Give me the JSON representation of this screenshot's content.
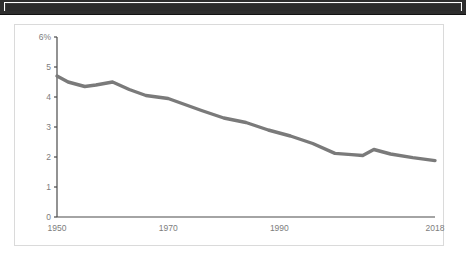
{
  "banner": {
    "name": "cropped-dark-banner-edge"
  },
  "chart_data": {
    "type": "line",
    "title": "",
    "subtitle": "",
    "xlabel": "",
    "ylabel": "",
    "grid": false,
    "legend": false,
    "line_color": "#7a7a7a",
    "axis_color": "#4a4a4a",
    "label_color": "#7d7d7d",
    "xlim": [
      1950,
      2018
    ],
    "ylim": [
      0,
      6
    ],
    "y_ticks": [
      0,
      1,
      2,
      3,
      4,
      5,
      6
    ],
    "y_tick_labels": [
      "0",
      "1",
      "2",
      "3",
      "4",
      "5",
      "6%"
    ],
    "x_ticks": [
      1950,
      1970,
      1990,
      2018
    ],
    "x_tick_labels": [
      "1950",
      "1970",
      "1990",
      "2018"
    ],
    "x": [
      1950,
      1952,
      1955,
      1957,
      1960,
      1963,
      1966,
      1970,
      1973,
      1976,
      1980,
      1984,
      1988,
      1992,
      1996,
      2000,
      2003,
      2005,
      2007,
      2010,
      2014,
      2018
    ],
    "values": [
      4.7,
      4.5,
      4.35,
      4.4,
      4.5,
      4.25,
      4.05,
      3.95,
      3.75,
      3.55,
      3.3,
      3.15,
      2.9,
      2.7,
      2.45,
      2.12,
      2.08,
      2.05,
      2.25,
      2.1,
      1.98,
      1.88
    ],
    "series": [
      {
        "name": "rate",
        "values": [
          4.7,
          4.5,
          4.35,
          4.4,
          4.5,
          4.25,
          4.05,
          3.95,
          3.75,
          3.55,
          3.3,
          3.15,
          2.9,
          2.7,
          2.45,
          2.12,
          2.08,
          2.05,
          2.25,
          2.1,
          1.98,
          1.88
        ]
      }
    ]
  }
}
